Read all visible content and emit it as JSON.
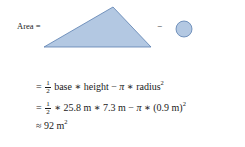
{
  "figure": {
    "label": "Area =",
    "operator": "−",
    "triangle": {
      "fill": "#b3c8e2",
      "stroke": "#5a7fb0",
      "points": "44,47 113,7 151,47"
    },
    "circle": {
      "fill": "#b3c8e2",
      "stroke": "#5a7fb0",
      "cx": 184,
      "cy": 29,
      "r": 8
    }
  },
  "equations": [
    {
      "prefix": "=",
      "frac_num": "1",
      "frac_den": "2",
      "rest_a": "base ∗ height − ",
      "pi": "π",
      "rest_b": " ∗ radius",
      "sup": "2",
      "tail": ""
    },
    {
      "prefix": "=",
      "frac_num": "1",
      "frac_den": "2",
      "rest_a": "∗ 25.8 m ∗ 7.3 m − ",
      "pi": "π",
      "rest_b": " ∗ (0.9 m)",
      "sup": "2",
      "tail": ""
    },
    {
      "prefix": "≈",
      "value": "92 m",
      "sup": "2"
    }
  ]
}
